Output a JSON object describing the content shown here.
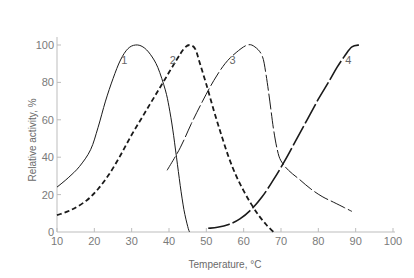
{
  "chart_data": {
    "type": "line",
    "title": "",
    "xlabel": "Temperature, °C",
    "ylabel": "Relative activity, %",
    "xlim": [
      10,
      100
    ],
    "ylim": [
      0,
      100
    ],
    "xticks": [
      10,
      20,
      30,
      40,
      50,
      60,
      70,
      80,
      90,
      100
    ],
    "yticks": [
      0,
      20,
      40,
      60,
      80,
      100
    ],
    "grid": false,
    "legend": "inline curve labels",
    "series": [
      {
        "name": "1",
        "style": "solid-thin",
        "label_pos": [
          28,
          90
        ],
        "points": [
          [
            10,
            24
          ],
          [
            13,
            29
          ],
          [
            16,
            35
          ],
          [
            19,
            44
          ],
          [
            21,
            56
          ],
          [
            23,
            70
          ],
          [
            25,
            82
          ],
          [
            27,
            92
          ],
          [
            29,
            98
          ],
          [
            31,
            100
          ],
          [
            33,
            99
          ],
          [
            35,
            95
          ],
          [
            37,
            88
          ],
          [
            39,
            76
          ],
          [
            40,
            67
          ],
          [
            41,
            55
          ],
          [
            42,
            40
          ],
          [
            43,
            25
          ],
          [
            44,
            12
          ],
          [
            45,
            3
          ],
          [
            45.5,
            0
          ]
        ]
      },
      {
        "name": "2",
        "style": "dashed-bold",
        "label_pos": [
          41,
          90
        ],
        "points": [
          [
            10,
            9
          ],
          [
            14,
            12
          ],
          [
            18,
            17
          ],
          [
            21,
            23
          ],
          [
            24,
            31
          ],
          [
            27,
            41
          ],
          [
            30,
            52
          ],
          [
            33,
            62
          ],
          [
            36,
            72
          ],
          [
            39,
            82
          ],
          [
            42,
            92
          ],
          [
            44,
            98
          ],
          [
            45.5,
            100
          ],
          [
            47,
            98
          ],
          [
            48,
            92
          ],
          [
            50,
            79
          ],
          [
            52,
            65
          ],
          [
            54,
            52
          ],
          [
            56,
            40
          ],
          [
            58,
            30
          ],
          [
            60,
            22
          ],
          [
            62,
            15
          ],
          [
            64,
            9
          ],
          [
            66,
            4
          ],
          [
            68,
            0
          ]
        ]
      },
      {
        "name": "3",
        "style": "longdash-thin",
        "label_pos": [
          57,
          90
        ],
        "points": [
          [
            39.5,
            33
          ],
          [
            43,
            45
          ],
          [
            46,
            58
          ],
          [
            49,
            70
          ],
          [
            52,
            81
          ],
          [
            55,
            90
          ],
          [
            58,
            96
          ],
          [
            61,
            100
          ],
          [
            63,
            99
          ],
          [
            65,
            94
          ],
          [
            66,
            84
          ],
          [
            67,
            70
          ],
          [
            68,
            55
          ],
          [
            69,
            44
          ],
          [
            70,
            38
          ],
          [
            72,
            33
          ],
          [
            75,
            28
          ],
          [
            78,
            23
          ],
          [
            81,
            19
          ],
          [
            84,
            16
          ],
          [
            87,
            13
          ],
          [
            89,
            11
          ]
        ]
      },
      {
        "name": "4",
        "style": "longdash-bold",
        "label_pos": [
          88,
          90
        ],
        "points": [
          [
            50.5,
            2
          ],
          [
            53,
            2.5
          ],
          [
            56,
            4
          ],
          [
            59,
            7
          ],
          [
            62,
            12
          ],
          [
            65,
            19
          ],
          [
            68,
            28
          ],
          [
            71,
            38
          ],
          [
            74,
            49
          ],
          [
            77,
            60
          ],
          [
            80,
            71
          ],
          [
            83,
            81
          ],
          [
            85,
            88
          ],
          [
            87,
            94
          ],
          [
            89,
            99
          ],
          [
            91,
            100
          ]
        ]
      }
    ]
  }
}
